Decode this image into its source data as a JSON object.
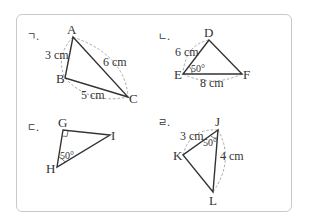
{
  "colors": {
    "line": "#333333",
    "dash": "#9a9a9a",
    "border": "#c9c9c9",
    "text": "#333333"
  },
  "figures": [
    {
      "id": "giyeok",
      "marker": "ㄱ.",
      "vertices": [
        {
          "name": "A",
          "x": 73,
          "y": 37
        },
        {
          "name": "B",
          "x": 65,
          "y": 78
        },
        {
          "name": "C",
          "x": 128,
          "y": 97
        }
      ],
      "labels": {
        "AB": "3 cm",
        "AC": "6 cm",
        "BC": "5 cm"
      }
    },
    {
      "id": "nieun",
      "marker": "ㄴ.",
      "vertices": [
        {
          "name": "D",
          "x": 209,
          "y": 40
        },
        {
          "name": "E",
          "x": 183,
          "y": 74
        },
        {
          "name": "F",
          "x": 242,
          "y": 74
        }
      ],
      "labels": {
        "DE": "6 cm",
        "EF": "8 cm",
        "angle_E": "50°"
      }
    },
    {
      "id": "digeut",
      "marker": "ㄷ.",
      "vertices": [
        {
          "name": "G",
          "x": 63,
          "y": 130
        },
        {
          "name": "H",
          "x": 57,
          "y": 167
        },
        {
          "name": "I",
          "x": 110,
          "y": 135
        }
      ],
      "labels": {
        "angle_H": "50°",
        "angle_G": "right-angle"
      }
    },
    {
      "id": "rieul",
      "marker": "ㄹ.",
      "vertices": [
        {
          "name": "J",
          "x": 218,
          "y": 130
        },
        {
          "name": "K",
          "x": 183,
          "y": 155
        },
        {
          "name": "L",
          "x": 213,
          "y": 192
        }
      ],
      "labels": {
        "JK": "3 cm",
        "JL": "4 cm",
        "angle_J": "50°"
      }
    }
  ]
}
